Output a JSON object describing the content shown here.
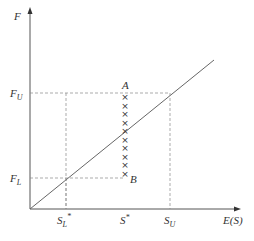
{
  "diagram": {
    "y_axis_label": "F",
    "x_axis_label": "E(S)",
    "y_ticks": [
      {
        "main": "F",
        "sub": "U"
      },
      {
        "main": "F",
        "sub": "L"
      }
    ],
    "x_ticks": [
      {
        "main": "S",
        "sub": "L",
        "sup": "*"
      },
      {
        "main": "S",
        "sup": "*"
      },
      {
        "main": "S",
        "sub": "U"
      }
    ],
    "point_a": "A",
    "point_b": "B",
    "cross_count": 10,
    "cross_glyph": "×"
  }
}
